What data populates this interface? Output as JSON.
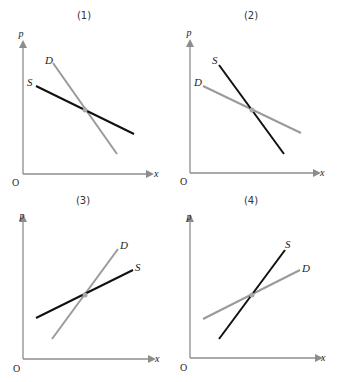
{
  "colors": {
    "supply": "#111111",
    "demand": "#9a9a9a",
    "axis": "#8c8c8c",
    "equilibrium_point": "#a8a8a8",
    "background": "#ffffff"
  },
  "axis_labels": {
    "y": "p",
    "x": "x",
    "origin": "O"
  },
  "panels": [
    {
      "title": "(1)",
      "supply_label": "S",
      "demand_label": "D",
      "description": "Both curves slope downward; supply flatter than demand"
    },
    {
      "title": "(2)",
      "supply_label": "S",
      "demand_label": "D",
      "description": "Both curves slope downward; supply steeper than demand"
    },
    {
      "title": "(3)",
      "supply_label": "S",
      "demand_label": "D",
      "description": "Both curves slope upward; supply flatter than demand"
    },
    {
      "title": "(4)",
      "supply_label": "S",
      "demand_label": "D",
      "description": "Both curves slope upward; supply steeper than demand"
    }
  ]
}
